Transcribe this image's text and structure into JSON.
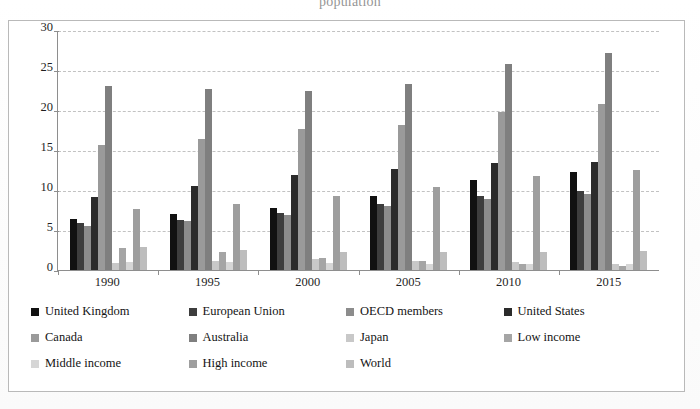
{
  "figure": {
    "title_fragment": "population",
    "x_axis_label": "",
    "y_axis_label": ""
  },
  "chart_data": {
    "type": "bar",
    "title": "population",
    "xlabel": "",
    "ylabel": "",
    "ylim": [
      0,
      30
    ],
    "yticks": [
      0,
      5,
      10,
      15,
      20,
      25,
      30
    ],
    "grid": true,
    "legend_position": "below",
    "categories": [
      "1990",
      "1995",
      "2000",
      "2005",
      "2010",
      "2015"
    ],
    "series": [
      {
        "name": "United Kingdom",
        "color": "#111111",
        "values": [
          6.4,
          7.0,
          7.7,
          9.2,
          11.3,
          12.3
        ]
      },
      {
        "name": "European Union",
        "color": "#3d3d3d",
        "values": [
          5.9,
          6.2,
          7.1,
          8.3,
          9.3,
          9.9
        ]
      },
      {
        "name": "OECD members",
        "color": "#8c8c8c",
        "values": [
          5.5,
          6.1,
          6.9,
          8.0,
          8.9,
          9.5
        ]
      },
      {
        "name": "United States",
        "color": "#2b2b2b",
        "values": [
          9.1,
          10.5,
          11.9,
          12.6,
          13.4,
          13.5
        ]
      },
      {
        "name": "Canada",
        "color": "#9a9a9a",
        "values": [
          15.6,
          16.4,
          17.6,
          18.1,
          19.7,
          20.8
        ]
      },
      {
        "name": "Australia",
        "color": "#7f7f7f",
        "values": [
          23.0,
          22.6,
          22.4,
          23.3,
          25.7,
          27.1
        ]
      },
      {
        "name": "Japan",
        "color": "#c8c8c8",
        "values": [
          0.9,
          1.1,
          1.4,
          1.1,
          1.0,
          0.8
        ]
      },
      {
        "name": "Low income",
        "color": "#a5a5a5",
        "values": [
          2.7,
          2.2,
          1.5,
          1.1,
          0.7,
          0.5
        ]
      },
      {
        "name": "Middle income",
        "color": "#d6d6d6",
        "values": [
          1.0,
          1.0,
          0.9,
          0.8,
          0.7,
          0.7
        ]
      },
      {
        "name": "High income",
        "color": "#9e9e9e",
        "values": [
          7.6,
          8.3,
          9.2,
          10.4,
          11.8,
          12.5
        ]
      },
      {
        "name": "World",
        "color": "#bdbdbd",
        "values": [
          2.9,
          2.5,
          2.3,
          2.3,
          2.3,
          2.4
        ]
      }
    ]
  },
  "legend": {
    "items": [
      {
        "label": "United Kingdom",
        "color": "#111111"
      },
      {
        "label": "European Union",
        "color": "#3d3d3d"
      },
      {
        "label": "OECD members",
        "color": "#8c8c8c"
      },
      {
        "label": "United States",
        "color": "#2b2b2b"
      },
      {
        "label": "Canada",
        "color": "#9a9a9a"
      },
      {
        "label": "Australia",
        "color": "#7f7f7f"
      },
      {
        "label": "Japan",
        "color": "#c8c8c8"
      },
      {
        "label": "Low income",
        "color": "#a5a5a5"
      },
      {
        "label": "Middle income",
        "color": "#d6d6d6"
      },
      {
        "label": "High income",
        "color": "#9e9e9e"
      },
      {
        "label": "World",
        "color": "#bdbdbd"
      }
    ]
  }
}
